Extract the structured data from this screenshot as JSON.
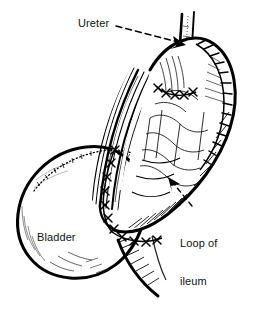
{
  "figure": {
    "kind": "medical-line-illustration",
    "cut_title_text": "THE OF THE BLADDER TO ILEUM",
    "ink_color": "#000000",
    "background_color": "#ffffff",
    "width": 258,
    "height": 310
  },
  "labels": {
    "ureter": "Ureter",
    "bladder": "Bladder",
    "loop_of_ileum_line1": "Loop of",
    "loop_of_ileum_line2": "ileum"
  },
  "leaders": [
    {
      "name": "ureter-leader",
      "style": "dashed",
      "from_x": 116,
      "from_y": 26,
      "to_x": 183,
      "to_y": 43,
      "arrowhead": true
    },
    {
      "name": "loop-of-ileum-leader",
      "style": "dashed",
      "from_x": 193,
      "from_y": 205,
      "to_x": 170,
      "to_y": 178,
      "arrowhead": true
    }
  ],
  "anatomy": [
    {
      "name": "bladder-sphere",
      "note": "large rounded viscus, lower left, bold outline with fine stipple shading"
    },
    {
      "name": "loop-of-ileum",
      "note": "bowel segment running diagonally from upper right to lower centre"
    },
    {
      "name": "ureter-tube",
      "note": "narrow tube descending from top, parallel walls, entering ileal loop"
    },
    {
      "name": "mesentery-hatching",
      "note": "dense parallel hatch lines behind bowel loop"
    },
    {
      "name": "anastomosis-suture-line",
      "note": "interrupted X-stitches joining bladder dome to ileal loop"
    },
    {
      "name": "ileum-closure-suture-line",
      "note": "running stitched seam along upper right border of ileum"
    }
  ]
}
